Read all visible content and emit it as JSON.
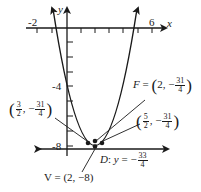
{
  "diagram": {
    "type": "parabola",
    "equation": "y = (x - 2)^2 - 8",
    "axes": {
      "x_label": "x",
      "y_label": "y",
      "x_tick_labels": [
        "-2",
        "6"
      ],
      "y_tick_labels": [
        "-4",
        "-8"
      ]
    },
    "annotations": {
      "focus": {
        "label": "F",
        "x": "2",
        "y_num": "31",
        "y_den": "4",
        "sign": "−"
      },
      "left_point": {
        "x_num": "3",
        "x_den": "2",
        "y_num": "31",
        "y_den": "4",
        "sign": "−"
      },
      "right_point": {
        "x_num": "5",
        "x_den": "2",
        "y_num": "31",
        "y_den": "4",
        "sign": "−"
      },
      "directrix": {
        "label": "D",
        "var": "y",
        "num": "33",
        "den": "4",
        "sign": "−"
      },
      "vertex": {
        "text": "V = (2, −8)"
      }
    },
    "colors": {
      "ink": "#1a1a1a",
      "background": "#ffffff"
    }
  }
}
